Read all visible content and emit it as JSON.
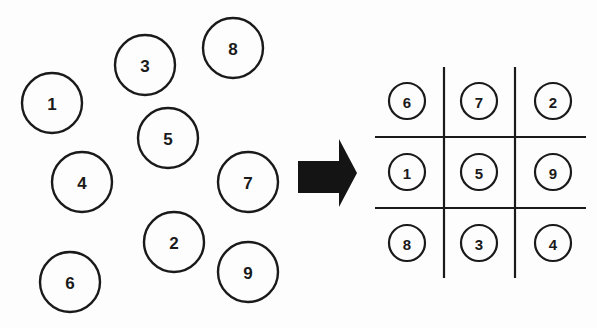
{
  "colors": {
    "ink": "#1a1a1a",
    "background": "#fdfdfd",
    "arrow": "#141414"
  },
  "scattered": {
    "radius": 30,
    "items": [
      {
        "label": "1",
        "cx": 52,
        "cy": 103
      },
      {
        "label": "3",
        "cx": 145,
        "cy": 65
      },
      {
        "label": "8",
        "cx": 233,
        "cy": 48
      },
      {
        "label": "5",
        "cx": 168,
        "cy": 138
      },
      {
        "label": "4",
        "cx": 82,
        "cy": 182
      },
      {
        "label": "7",
        "cx": 248,
        "cy": 182
      },
      {
        "label": "2",
        "cx": 174,
        "cy": 242
      },
      {
        "label": "9",
        "cx": 248,
        "cy": 272
      },
      {
        "label": "6",
        "cx": 70,
        "cy": 282
      }
    ]
  },
  "arrow": {
    "icon": "right-arrow-icon",
    "direction": "right"
  },
  "grid": {
    "rows": 3,
    "cols": 3,
    "radius": 18,
    "cells": [
      [
        "6",
        "7",
        "2"
      ],
      [
        "1",
        "5",
        "9"
      ],
      [
        "8",
        "3",
        "4"
      ]
    ]
  }
}
